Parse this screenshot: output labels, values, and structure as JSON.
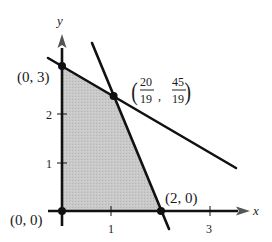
{
  "diagram": {
    "type": "linear-programming-feasible-region",
    "axes": {
      "x_label": "x",
      "y_label": "y",
      "x_ticks": [
        "1",
        "3"
      ],
      "y_ticks": [
        "1",
        "2"
      ]
    },
    "vertices": [
      {
        "label": "(0, 0)",
        "x": 0,
        "y": 0
      },
      {
        "label": "(0, 3)",
        "x": 0,
        "y": 3
      },
      {
        "label": "(2, 0)",
        "x": 2,
        "y": 0
      },
      {
        "label_num_x": "20",
        "label_den_x": "19",
        "label_num_y": "45",
        "label_den_y": "19",
        "x": 1.0526,
        "y": 2.3684
      }
    ],
    "lines": [
      {
        "equation": "y = 3 - 0.6x"
      },
      {
        "equation": "y = 4.5 - 2.25x"
      }
    ],
    "region_color": "#c8c8c8",
    "line_color": "#111111"
  },
  "labels": {
    "v00": "(0, 0)",
    "v03": "(0, 3)",
    "v20": "(2, 0)",
    "int_x_num": "20",
    "int_x_den": "19",
    "int_y_num": "45",
    "int_y_den": "19",
    "x_axis": "x",
    "y_axis": "y",
    "tick_x1": "1",
    "tick_x3": "3",
    "tick_y1": "1",
    "tick_y2": "2"
  }
}
